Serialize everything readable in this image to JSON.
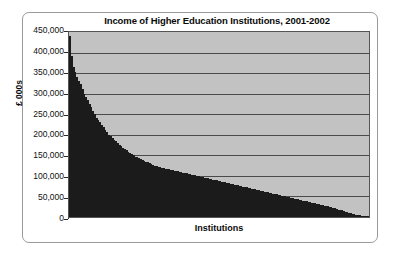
{
  "chart_data": {
    "type": "bar",
    "title": "Income of Higher Education Institutions, 2001-2002",
    "xlabel": "Institutions",
    "ylabel": "£ 000s",
    "ylim": [
      0,
      450000
    ],
    "grid": true,
    "legend": null,
    "legend_position": "none",
    "sorted": "descending",
    "x_tick_labels": [],
    "y_tick_labels": [
      "450,000",
      "400,000",
      "350,000",
      "300,000",
      "250,000",
      "200,000",
      "150,000",
      "100,000",
      "50,000",
      "0"
    ],
    "y_ticks": [
      450000,
      400000,
      350000,
      300000,
      250000,
      200000,
      150000,
      100000,
      50000,
      0
    ],
    "bar_color": "#1b1b1b",
    "plot_background": "#c2c2c2",
    "categories": [
      "1",
      "2",
      "3",
      "4",
      "5",
      "6",
      "7",
      "8",
      "9",
      "10",
      "11",
      "12",
      "13",
      "14",
      "15",
      "16",
      "17",
      "18",
      "19",
      "20",
      "21",
      "22",
      "23",
      "24",
      "25",
      "26",
      "27",
      "28",
      "29",
      "30",
      "31",
      "32",
      "33",
      "34",
      "35",
      "36",
      "37",
      "38",
      "39",
      "40",
      "41",
      "42",
      "43",
      "44",
      "45",
      "46",
      "47",
      "48",
      "49",
      "50",
      "51",
      "52",
      "53",
      "54",
      "55",
      "56",
      "57",
      "58",
      "59",
      "60",
      "61",
      "62",
      "63",
      "64",
      "65",
      "66",
      "67",
      "68",
      "69",
      "70",
      "71",
      "72",
      "73",
      "74",
      "75",
      "76",
      "77",
      "78",
      "79",
      "80",
      "81",
      "82",
      "83",
      "84",
      "85",
      "86",
      "87",
      "88",
      "89",
      "90",
      "91",
      "92",
      "93",
      "94",
      "95",
      "96",
      "97",
      "98",
      "99",
      "100",
      "101",
      "102",
      "103",
      "104",
      "105",
      "106",
      "107",
      "108",
      "109",
      "110",
      "111",
      "112",
      "113",
      "114",
      "115",
      "116",
      "117",
      "118",
      "119",
      "120",
      "121",
      "122",
      "123",
      "124",
      "125",
      "126",
      "127",
      "128",
      "129",
      "130",
      "131",
      "132",
      "133",
      "134",
      "135",
      "136",
      "137",
      "138",
      "139",
      "140",
      "141",
      "142",
      "143",
      "144",
      "145",
      "146",
      "147",
      "148",
      "149",
      "150",
      "151",
      "152",
      "153",
      "154",
      "155",
      "156",
      "157",
      "158",
      "159",
      "160",
      "161",
      "162",
      "163",
      "164",
      "165",
      "166",
      "167",
      "168",
      "169",
      "170"
    ],
    "values": [
      440000,
      392000,
      366000,
      352000,
      341000,
      332000,
      324000,
      312000,
      300000,
      292000,
      284000,
      276000,
      268000,
      258000,
      250000,
      242000,
      236000,
      230000,
      224000,
      218000,
      212000,
      206000,
      200000,
      196000,
      192000,
      188000,
      184000,
      180000,
      176000,
      172000,
      168000,
      165000,
      162000,
      159000,
      156000,
      153000,
      150000,
      147000,
      145000,
      143000,
      141000,
      139000,
      137000,
      135000,
      133000,
      131000,
      129000,
      127000,
      125000,
      124000,
      122000,
      121000,
      120000,
      119000,
      118000,
      117000,
      116000,
      115000,
      114000,
      113000,
      112000,
      111000,
      110000,
      109000,
      108000,
      107000,
      106000,
      105000,
      104000,
      103000,
      102000,
      101000,
      100000,
      99000,
      98000,
      97000,
      96000,
      95000,
      94000,
      93000,
      92000,
      91000,
      90000,
      89000,
      88000,
      87000,
      86000,
      85000,
      84000,
      83000,
      82000,
      81000,
      80000,
      79000,
      78000,
      77000,
      76000,
      75000,
      74000,
      73000,
      72000,
      71000,
      70000,
      69000,
      68000,
      67000,
      66000,
      65000,
      64000,
      63000,
      62000,
      61000,
      60000,
      59000,
      58000,
      57000,
      56000,
      55000,
      54000,
      53000,
      52000,
      51000,
      50000,
      49000,
      48000,
      47000,
      46000,
      45000,
      44000,
      43000,
      42000,
      41000,
      40000,
      39000,
      38000,
      37000,
      36000,
      35000,
      34000,
      33000,
      32000,
      31000,
      30000,
      29000,
      28000,
      27000,
      26000,
      25000,
      24000,
      22000,
      21000,
      20000,
      18000,
      17000,
      16000,
      15000,
      13000,
      12000,
      10000,
      9000,
      8000,
      7000,
      6000,
      5000,
      4000,
      3500,
      3000,
      2500,
      2000,
      1200
    ]
  }
}
